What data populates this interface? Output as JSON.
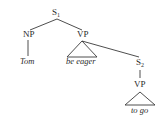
{
  "diagram": {
    "type": "syntax-tree",
    "nodes": {
      "s1": {
        "label": "S",
        "sub": "1"
      },
      "np": {
        "label": "NP"
      },
      "vp1": {
        "label": "VP"
      },
      "tom": {
        "label": "Tom"
      },
      "be_eager": {
        "label": "be eager"
      },
      "s2": {
        "label": "S",
        "sub": "2"
      },
      "vp2": {
        "label": "VP"
      },
      "to_go": {
        "label": "to go"
      }
    },
    "edges": [
      [
        "S1",
        "NP"
      ],
      [
        "S1",
        "VP"
      ],
      [
        "NP",
        "Tom"
      ],
      [
        "VP",
        "be eager (triangle)"
      ],
      [
        "VP",
        "S2"
      ],
      [
        "S2",
        "VP"
      ],
      [
        "VP",
        "to go (triangle)"
      ]
    ]
  }
}
